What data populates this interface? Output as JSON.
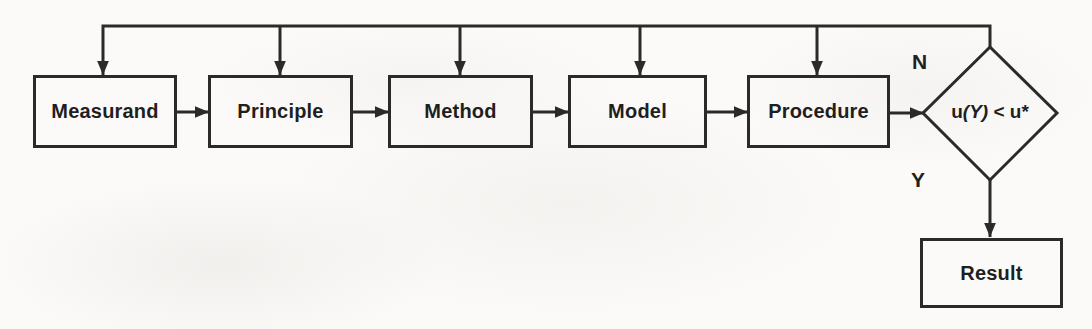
{
  "flowchart": {
    "stages": [
      {
        "label": "Measurand"
      },
      {
        "label": "Principle"
      },
      {
        "label": "Method"
      },
      {
        "label": "Model"
      },
      {
        "label": "Procedure"
      }
    ],
    "decision": {
      "prefix": "u",
      "italic": "(Y)",
      "suffix": " < u*"
    },
    "branches": {
      "no": "N",
      "yes": "Y"
    },
    "result": {
      "label": "Result"
    },
    "colors": {
      "line": "#2a2a2a",
      "text": "#1f1f1f",
      "background": "#fbfaf8"
    }
  }
}
